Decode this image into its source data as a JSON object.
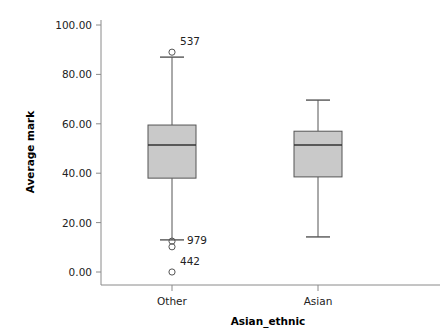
{
  "chart_data": {
    "type": "box",
    "title": "",
    "xlabel": "Asian_ethnic",
    "ylabel": "Average mark",
    "categories": [
      "Other",
      "Asian"
    ],
    "ylim": [
      0,
      100
    ],
    "yticks": [
      0,
      20,
      40,
      60,
      80,
      100
    ],
    "ytick_labels": [
      "0.00",
      "20.00",
      "40.00",
      "60.00",
      "80.00",
      "100.00"
    ],
    "grid": false,
    "legend": null,
    "series": [
      {
        "name": "Other",
        "category": "Other",
        "whisker_high": 87.0,
        "q3": 59.5,
        "median": 51.4,
        "q1": 38.0,
        "whisker_low": 13.0,
        "outliers": [
          {
            "value": 89.0,
            "label": "537"
          },
          {
            "value": 12.5,
            "label": ""
          },
          {
            "value": 10.2,
            "label": ""
          },
          {
            "value": 0.0,
            "label": "442"
          }
        ],
        "whisker_low_label": "979"
      },
      {
        "name": "Asian",
        "category": "Asian",
        "whisker_high": 69.6,
        "q3": 57.0,
        "median": 51.4,
        "q1": 38.5,
        "whisker_low": 14.2,
        "outliers": [],
        "whisker_low_label": ""
      }
    ],
    "colors": {
      "box_fill": "#c9c9c9",
      "box_stroke": "#555555",
      "whisker": "#555555",
      "median": "#333333",
      "axis": "#888888",
      "text": "#222222"
    }
  }
}
